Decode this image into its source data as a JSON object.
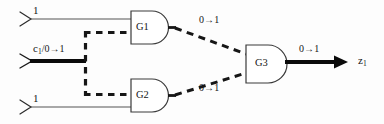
{
  "diagram": {
    "type": "logic-circuit-fault-propagation",
    "width": 384,
    "height": 124,
    "colors": {
      "line": "#2b2b2b",
      "thick_line": "#0a0a0a",
      "gate_outline": "#3a3a3a",
      "background": "#fdfdfd",
      "text": "#161616"
    }
  },
  "inputs": [
    {
      "id": "in-top",
      "label": "1",
      "x": 50,
      "y": 14,
      "style": "thin"
    },
    {
      "id": "in-mid",
      "label_main": "c",
      "label_sub": "1",
      "label_rest": "/0→1",
      "label_full": "c1/0→1",
      "x": 48,
      "y": 50,
      "style": "thick"
    },
    {
      "id": "in-bot",
      "label": "1",
      "x": 50,
      "y": 96,
      "style": "thin"
    }
  ],
  "gates": [
    {
      "id": "G1",
      "label": "G1",
      "type": "AND",
      "x": 130,
      "y": 11,
      "w": 42,
      "h": 33
    },
    {
      "id": "G2",
      "label": "G2",
      "type": "AND",
      "x": 130,
      "y": 79,
      "w": 42,
      "h": 33
    },
    {
      "id": "G3",
      "label": "G3",
      "type": "AND",
      "x": 245,
      "y": 45,
      "w": 45,
      "h": 38
    }
  ],
  "wire_labels": [
    {
      "id": "g1-out-value",
      "text": "0→1",
      "x": 202,
      "y": 20
    },
    {
      "id": "g2-out-value",
      "text": "0→1",
      "x": 202,
      "y": 88
    },
    {
      "id": "g3-out-value",
      "text": "0→1",
      "x": 301,
      "y": 43
    }
  ],
  "output": {
    "id": "z1",
    "label_main": "z",
    "label_sub": "1",
    "label_full": "z1",
    "x": 360,
    "y": 55,
    "style": "thick-arrow"
  },
  "legend": {
    "fault_value": "0→1",
    "control_signal": "c1"
  }
}
